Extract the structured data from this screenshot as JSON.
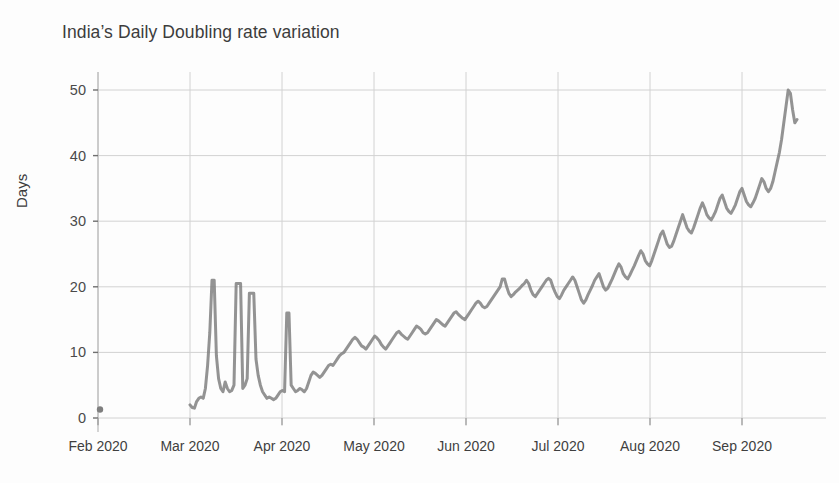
{
  "chart_data": {
    "type": "line",
    "title": "India’s Daily Doubling rate variation",
    "xlabel": "",
    "ylabel": "Days",
    "ylim": [
      0,
      52
    ],
    "yticks": [
      0,
      10,
      20,
      30,
      40,
      50
    ],
    "ytick_labels": [
      "0",
      "10",
      "20",
      "30",
      "40",
      "50"
    ],
    "xtick_labels": [
      "Feb 2020",
      "Mar 2020",
      "Apr 2020",
      "May 2020",
      "Jun 2020",
      "Jul 2020",
      "Aug 2020",
      "Sep 2020"
    ],
    "xlim_labels": [
      "Feb 2020",
      "Sep 2020"
    ],
    "grid": true,
    "legend": "none",
    "line_color": "#808080",
    "line_width": 3,
    "marker_note": "small dot marker near origin at Feb 2020, value 1",
    "series": [
      {
        "name": "Daily doubling rate",
        "x_start_label": "Mar 2020",
        "values": [
          2.0,
          1.6,
          1.5,
          2.5,
          3.0,
          3.2,
          3.0,
          4.5,
          8.0,
          13.0,
          21.0,
          21.0,
          9.5,
          6.0,
          4.5,
          4.0,
          5.5,
          4.5,
          4.0,
          4.2,
          5.0,
          20.5,
          20.5,
          20.5,
          4.5,
          5.0,
          6.0,
          19.0,
          19.0,
          19.0,
          9.0,
          6.5,
          5.0,
          4.0,
          3.5,
          3.0,
          3.2,
          3.0,
          2.8,
          3.0,
          3.5,
          4.0,
          4.2,
          4.0,
          16.0,
          16.0,
          5.0,
          4.5,
          4.0,
          4.2,
          4.5,
          4.3,
          4.0,
          4.5,
          5.5,
          6.5,
          7.0,
          6.8,
          6.5,
          6.2,
          6.5,
          7.0,
          7.5,
          8.0,
          8.2,
          8.0,
          8.5,
          9.0,
          9.5,
          9.8,
          10.0,
          10.5,
          11.0,
          11.5,
          12.0,
          12.3,
          12.0,
          11.5,
          11.0,
          10.8,
          10.5,
          11.0,
          11.5,
          12.0,
          12.5,
          12.2,
          11.8,
          11.2,
          10.8,
          10.5,
          11.0,
          11.5,
          12.0,
          12.5,
          13.0,
          13.2,
          12.8,
          12.5,
          12.2,
          12.0,
          12.5,
          13.0,
          13.5,
          14.0,
          13.8,
          13.5,
          13.0,
          12.8,
          13.0,
          13.5,
          14.0,
          14.5,
          15.0,
          14.8,
          14.5,
          14.2,
          14.0,
          14.5,
          15.0,
          15.5,
          16.0,
          16.2,
          15.8,
          15.5,
          15.2,
          15.0,
          15.5,
          16.0,
          16.5,
          17.0,
          17.5,
          17.8,
          17.5,
          17.0,
          16.8,
          17.0,
          17.5,
          18.0,
          18.5,
          19.0,
          19.5,
          20.0,
          21.2,
          21.2,
          20.0,
          19.0,
          18.5,
          18.8,
          19.2,
          19.5,
          19.8,
          20.2,
          20.5,
          21.0,
          20.5,
          19.5,
          18.8,
          18.5,
          19.0,
          19.5,
          20.0,
          20.5,
          21.0,
          21.3,
          21.0,
          20.0,
          19.2,
          18.5,
          18.2,
          18.8,
          19.5,
          20.0,
          20.5,
          21.0,
          21.5,
          21.0,
          20.0,
          19.0,
          18.0,
          17.5,
          18.0,
          18.8,
          19.5,
          20.2,
          21.0,
          21.5,
          22.0,
          21.0,
          20.0,
          19.5,
          19.8,
          20.5,
          21.2,
          22.0,
          22.8,
          23.5,
          23.0,
          22.0,
          21.5,
          21.2,
          21.8,
          22.5,
          23.2,
          24.0,
          24.8,
          25.5,
          25.0,
          24.0,
          23.5,
          23.2,
          24.0,
          25.0,
          26.0,
          27.0,
          28.0,
          28.5,
          27.5,
          26.5,
          26.0,
          26.2,
          27.0,
          28.0,
          29.0,
          30.0,
          31.0,
          30.0,
          29.0,
          28.5,
          28.2,
          29.0,
          30.0,
          31.0,
          32.0,
          32.8,
          32.0,
          31.0,
          30.5,
          30.2,
          30.8,
          31.5,
          32.5,
          33.5,
          34.0,
          33.0,
          32.0,
          31.5,
          31.2,
          31.8,
          32.5,
          33.5,
          34.5,
          35.0,
          34.0,
          33.0,
          32.5,
          32.2,
          32.8,
          33.5,
          34.5,
          35.5,
          36.5,
          36.0,
          35.0,
          34.5,
          35.0,
          36.0,
          37.5,
          39.0,
          40.5,
          42.5,
          45.0,
          47.5,
          50.0,
          49.5,
          47.0,
          45.0,
          45.5
        ]
      }
    ],
    "origin_marker": {
      "x_label": "Feb 2020",
      "value": 1
    }
  }
}
